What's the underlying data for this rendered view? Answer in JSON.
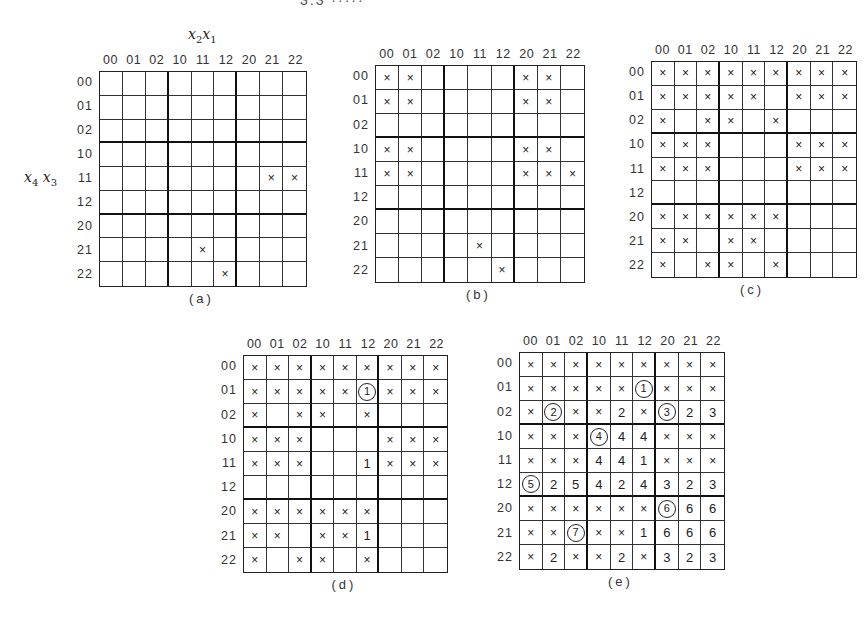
{
  "header_fragment": "3.3  ·····",
  "axis": {
    "col_var": [
      "x",
      "2",
      "x",
      "1"
    ],
    "row_var": [
      "x",
      "4",
      "x",
      "3"
    ]
  },
  "col_labels": [
    "00",
    "01",
    "02",
    "10",
    "11",
    "12",
    "20",
    "21",
    "22"
  ],
  "row_labels": [
    "00",
    "01",
    "02",
    "10",
    "11",
    "12",
    "20",
    "21",
    "22"
  ],
  "maps": [
    {
      "id": "a",
      "caption": "(a)",
      "rect": [
        99,
        71,
        208,
        216
      ],
      "show_axis_labels": true,
      "cells": [
        [
          "",
          "",
          "",
          "",
          "",
          "",
          "",
          "",
          ""
        ],
        [
          "",
          "",
          "",
          "",
          "",
          "",
          "",
          "",
          ""
        ],
        [
          "",
          "",
          "",
          "",
          "",
          "",
          "",
          "",
          ""
        ],
        [
          "",
          "",
          "",
          "",
          "",
          "",
          "",
          "",
          ""
        ],
        [
          "",
          "",
          "",
          "",
          "",
          "",
          "",
          "x",
          "x"
        ],
        [
          "",
          "",
          "",
          "",
          "",
          "",
          "",
          "",
          ""
        ],
        [
          "",
          "",
          "",
          "",
          "",
          "",
          "",
          "",
          ""
        ],
        [
          "",
          "",
          "",
          "",
          "x",
          "",
          "",
          "",
          ""
        ],
        [
          "",
          "",
          "",
          "",
          "",
          "x",
          "",
          "",
          ""
        ]
      ]
    },
    {
      "id": "b",
      "caption": "(b)",
      "rect": [
        375,
        65,
        210,
        218
      ],
      "show_axis_labels": false,
      "cells": [
        [
          "x",
          "x",
          "",
          "",
          "",
          "",
          "x",
          "x",
          ""
        ],
        [
          "x",
          "x",
          "",
          "",
          "",
          "",
          "x",
          "x",
          ""
        ],
        [
          "",
          "",
          "",
          "",
          "",
          "",
          "",
          "",
          ""
        ],
        [
          "x",
          "x",
          "",
          "",
          "",
          "",
          "x",
          "x",
          ""
        ],
        [
          "x",
          "x",
          "",
          "",
          "",
          "",
          "x",
          "x",
          "x"
        ],
        [
          "",
          "",
          "",
          "",
          "",
          "",
          "",
          "",
          ""
        ],
        [
          "",
          "",
          "",
          "",
          "",
          "",
          "",
          "",
          ""
        ],
        [
          "",
          "",
          "",
          "",
          "x",
          "",
          "",
          "",
          ""
        ],
        [
          "",
          "",
          "",
          "",
          "",
          "x",
          "",
          "",
          ""
        ]
      ]
    },
    {
      "id": "c",
      "caption": "(c)",
      "rect": [
        651,
        61,
        206,
        217
      ],
      "show_axis_labels": false,
      "cells": [
        [
          "x",
          "x",
          "x",
          "x",
          "x",
          "x",
          "x",
          "x",
          "x"
        ],
        [
          "x",
          "x",
          "x",
          "x",
          "x",
          "",
          "x",
          "x",
          "x"
        ],
        [
          "x",
          "",
          "x",
          "x",
          "",
          "x",
          "",
          "",
          ""
        ],
        [
          "x",
          "x",
          "x",
          "",
          "",
          "",
          "x",
          "x",
          "x"
        ],
        [
          "x",
          "x",
          "x",
          "",
          "",
          "",
          "x",
          "x",
          "x"
        ],
        [
          "",
          "",
          "",
          "",
          "",
          "",
          "",
          "",
          ""
        ],
        [
          "x",
          "x",
          "x",
          "x",
          "x",
          "x",
          "",
          "",
          ""
        ],
        [
          "x",
          "x",
          "",
          "x",
          "x",
          "",
          "",
          "",
          ""
        ],
        [
          "x",
          "",
          "x",
          "x",
          "",
          "x",
          "",
          "",
          ""
        ]
      ]
    },
    {
      "id": "d",
      "caption": "(d)",
      "rect": [
        243,
        355,
        205,
        218
      ],
      "show_axis_labels": false,
      "cells": [
        [
          "x",
          "x",
          "x",
          "x",
          "x",
          "x",
          "x",
          "x",
          "x"
        ],
        [
          "x",
          "x",
          "x",
          "x",
          "x",
          "(1)",
          "x",
          "x",
          "x"
        ],
        [
          "x",
          "",
          "x",
          "x",
          "",
          "x",
          "",
          "",
          ""
        ],
        [
          "x",
          "x",
          "x",
          "",
          "",
          "",
          "x",
          "x",
          "x"
        ],
        [
          "x",
          "x",
          "x",
          "",
          "",
          "1",
          "x",
          "x",
          "x"
        ],
        [
          "",
          "",
          "",
          "",
          "",
          "",
          "",
          "",
          ""
        ],
        [
          "x",
          "x",
          "x",
          "x",
          "x",
          "x",
          "",
          "",
          ""
        ],
        [
          "x",
          "x",
          "",
          "x",
          "x",
          "1",
          "",
          "",
          ""
        ],
        [
          "x",
          "",
          "x",
          "x",
          "",
          "x",
          "",
          "",
          ""
        ]
      ]
    },
    {
      "id": "e",
      "caption": "(e)",
      "rect": [
        519,
        352,
        206,
        218
      ],
      "show_axis_labels": false,
      "cells": [
        [
          "x",
          "x",
          "x",
          "x",
          "x",
          "x",
          "x",
          "x",
          "x"
        ],
        [
          "x",
          "x",
          "x",
          "x",
          "x",
          "(1)",
          "x",
          "x",
          "x"
        ],
        [
          "x",
          "(2)",
          "x",
          "x",
          "2",
          "x",
          "(3)",
          "2",
          "3"
        ],
        [
          "x",
          "x",
          "x",
          "(4)",
          "4",
          "4",
          "x",
          "x",
          "x"
        ],
        [
          "x",
          "x",
          "x",
          "4",
          "4",
          "1",
          "x",
          "x",
          "x"
        ],
        [
          "(5)",
          "2",
          "5",
          "4",
          "2",
          "4",
          "3",
          "2",
          "3"
        ],
        [
          "x",
          "x",
          "x",
          "x",
          "x",
          "x",
          "(6)",
          "6",
          "6"
        ],
        [
          "x",
          "x",
          "(7)",
          "x",
          "x",
          "1",
          "6",
          "6",
          "6"
        ],
        [
          "x",
          "2",
          "x",
          "x",
          "2",
          "x",
          "3",
          "2",
          "3"
        ]
      ]
    }
  ]
}
